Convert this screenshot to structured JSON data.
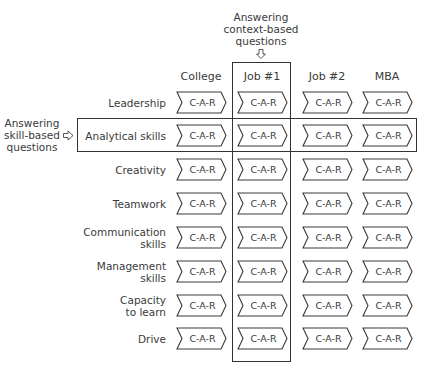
{
  "annotations": {
    "top": {
      "lines": [
        "Answering",
        "context-based",
        "questions"
      ],
      "arrow": "down-arrow"
    },
    "left": {
      "lines": [
        "Answering",
        "skill-based",
        "questions"
      ],
      "arrow": "right-arrow"
    }
  },
  "columns": [
    "College",
    "Job #1",
    "Job #2",
    "MBA"
  ],
  "cell_label": "C-A-R",
  "rows": [
    {
      "label": [
        "Leadership"
      ]
    },
    {
      "label": [
        "Analytical skills"
      ]
    },
    {
      "label": [
        "Creativity"
      ]
    },
    {
      "label": [
        "Teamwork"
      ]
    },
    {
      "label": [
        "Communication",
        "skills"
      ]
    },
    {
      "label": [
        "Management",
        "skills"
      ]
    },
    {
      "label": [
        "Capacity",
        "to learn"
      ]
    },
    {
      "label": [
        "Drive"
      ]
    }
  ],
  "highlights": {
    "column": "Job #1",
    "row": "Analytical skills"
  }
}
